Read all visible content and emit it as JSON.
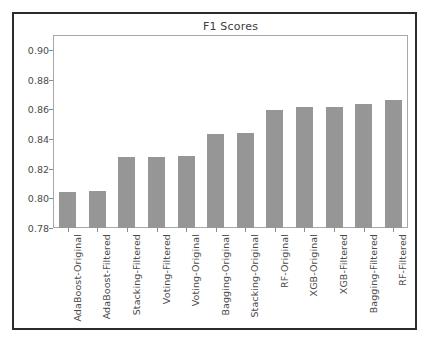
{
  "figure": {
    "background_color": "#ffffff",
    "frame_color": "#2b2b2b",
    "axes_edge_color": "#a8a8a8",
    "bar_color": "#969696",
    "text_color": "#4a4a4a"
  },
  "chart_data": {
    "type": "bar",
    "title": "F1 Scores",
    "xlabel": "",
    "ylabel": "",
    "ylim": [
      0.78,
      0.91
    ],
    "yticks": [
      0.78,
      0.8,
      0.82,
      0.84,
      0.86,
      0.88,
      0.9
    ],
    "ytick_labels": [
      "0.78",
      "0.80",
      "0.82",
      "0.84",
      "0.86",
      "0.88",
      "0.90"
    ],
    "grid": false,
    "legend": null,
    "categories": [
      "AdaBoost-Original",
      "AdaBoost-Filtered",
      "Stacking-Filtered",
      "Voting-Filtered",
      "Voting-Original",
      "Bagging-Original",
      "Stacking-Original",
      "RF-Original",
      "XGB-Original",
      "XGB-Filtered",
      "Bagging-Filtered",
      "RF-Filtered"
    ],
    "values": [
      0.8045,
      0.8047,
      0.8276,
      0.8276,
      0.8288,
      0.843,
      0.844,
      0.8592,
      0.8615,
      0.8615,
      0.8637,
      0.8662
    ]
  }
}
